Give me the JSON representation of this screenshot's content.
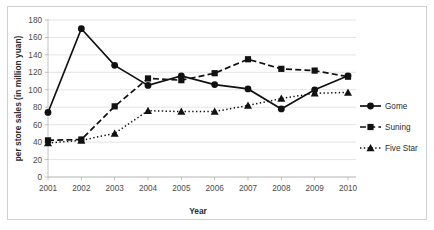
{
  "chart_data": {
    "type": "line",
    "title": "",
    "xlabel": "Year",
    "ylabel": "per store sales (in million yuan)",
    "categories": [
      "2001",
      "2002",
      "2003",
      "2004",
      "2005",
      "2006",
      "2007",
      "2008",
      "2009",
      "2010"
    ],
    "x": [
      2001,
      2002,
      2003,
      2004,
      2005,
      2006,
      2007,
      2008,
      2009,
      2010
    ],
    "xlim": [
      2001,
      2010
    ],
    "ylim": [
      0,
      180
    ],
    "yticks": [
      0,
      20,
      40,
      60,
      80,
      100,
      120,
      140,
      160,
      180
    ],
    "ytick_labels": [
      "0",
      "20",
      "40",
      "60",
      "80",
      "100",
      "120",
      "140",
      "160",
      "180"
    ],
    "grid": true,
    "grid_axis": "y",
    "legend_position": "right",
    "series": [
      {
        "name": "Gome",
        "marker": "circle",
        "linestyle": "solid",
        "color": "#111111",
        "values": [
          74,
          170,
          128,
          105,
          116,
          106,
          101,
          78,
          100,
          116
        ]
      },
      {
        "name": "Suning",
        "marker": "square",
        "linestyle": "dashed",
        "color": "#111111",
        "values": [
          42,
          43,
          81,
          113,
          111,
          119,
          135,
          124,
          122,
          115
        ]
      },
      {
        "name": "Five Star",
        "marker": "triangle",
        "linestyle": "dotted",
        "color": "#111111",
        "values": [
          39,
          42,
          50,
          76,
          75,
          75,
          82,
          90,
          96,
          97
        ]
      }
    ]
  },
  "legend": {
    "entries": [
      {
        "label": "Gome"
      },
      {
        "label": "Suning"
      },
      {
        "label": "Five Star"
      }
    ]
  },
  "axes": {
    "x_title": "Year",
    "y_title": "per store sales (in million yuan)"
  }
}
